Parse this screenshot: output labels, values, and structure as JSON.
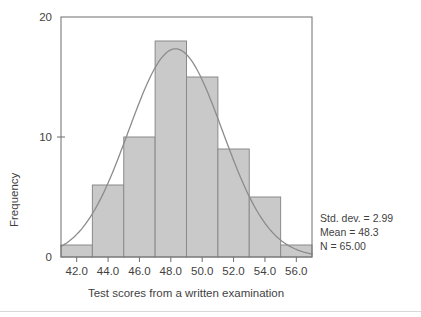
{
  "chart_data": {
    "type": "bar",
    "title": "",
    "subtitle": "",
    "xlabel": "Test scores from a written examination",
    "ylabel": "Frequency",
    "categories": [
      "41-43",
      "43-45",
      "45-47",
      "47-49",
      "49-51",
      "51-53",
      "53-55",
      "55-57"
    ],
    "bin_edges": [
      41,
      43,
      45,
      47,
      49,
      51,
      53,
      55,
      57
    ],
    "values": [
      1,
      6,
      10,
      18,
      15,
      9,
      5,
      1
    ],
    "xlim": [
      41,
      57
    ],
    "ylim": [
      0,
      20
    ],
    "xticks": [
      42.0,
      44.0,
      46.0,
      48.0,
      50.0,
      52.0,
      54.0,
      56.0
    ],
    "xtick_labels": [
      "42.0",
      "44.0",
      "46.0",
      "48.0",
      "50.0",
      "52.0",
      "54.0",
      "56.0"
    ],
    "yticks": [
      0,
      10,
      20
    ],
    "ytick_labels": [
      "0",
      "10",
      "20"
    ],
    "grid": false,
    "legend": "none",
    "overlay": {
      "type": "normal-curve",
      "mean": 48.3,
      "std_dev": 2.99,
      "n": 65,
      "bin_width": 2,
      "peak_value": 17.3
    },
    "annotations": [
      "Std. dev. = 2.99",
      "Mean = 48.3",
      "N = 65.00"
    ],
    "colors": {
      "bar_fill": "#c9c9c9",
      "bar_stroke": "#8a8a8a",
      "curve": "#8c8c8c",
      "axis": "#6e6e6e",
      "text": "#3f3f3f",
      "background": "#ffffff",
      "footer_rule": "#d8d8d8"
    }
  },
  "stats": {
    "std_dev_label": "Std. dev. = 2.99",
    "mean_label": "Mean = 48.3",
    "n_label": "N = 65.00"
  },
  "axes": {
    "x_title": "Test scores from a written examination",
    "y_title": "Frequency"
  }
}
